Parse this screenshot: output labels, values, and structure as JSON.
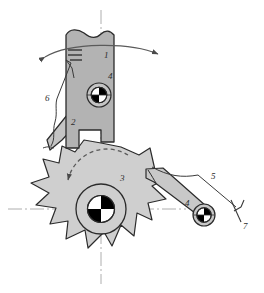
{
  "diagram": {
    "type": "mechanical-kinematic-schematic",
    "background": "#ffffff",
    "colors": {
      "outline": "#2b2b2b",
      "wheel_fill": "#cfcfcf",
      "bar_fill": "#b3b3b3",
      "pawl_fill": "#c4c4c4",
      "arm_fill": "#c8c8c8",
      "joint_black": "#000000",
      "joint_white": "#ffffff",
      "centerline": "#9a9a9a",
      "leader": "#3a3a3a"
    },
    "labels": [
      {
        "id": "1",
        "text": "1",
        "x": 104,
        "y": 55,
        "refers_to": "oscillating-driver-bar"
      },
      {
        "id": "2",
        "text": "2",
        "x": 71,
        "y": 122,
        "refers_to": "driving-pawl"
      },
      {
        "id": "3",
        "text": "3",
        "x": 120,
        "y": 178,
        "refers_to": "ratchet-wheel"
      },
      {
        "id": "4a",
        "text": "4",
        "x": 108,
        "y": 76,
        "refers_to": "pin-joint-upper"
      },
      {
        "id": "4b",
        "text": "4",
        "x": 188,
        "y": 203,
        "refers_to": "holding-arm"
      },
      {
        "id": "5",
        "text": "5",
        "x": 211,
        "y": 176,
        "refers_to": "return-spring-right"
      },
      {
        "id": "6",
        "text": "6",
        "x": 46,
        "y": 98,
        "refers_to": "return-spring-left"
      },
      {
        "id": "7",
        "text": "7",
        "x": 245,
        "y": 225,
        "refers_to": "fixed-ground-support"
      }
    ],
    "annotations": {
      "oscillation_arc": "double-headed arc arrow above bar 1 indicating reciprocating swing",
      "rotation_arc": "dashed curved arrow inside wheel indicating counter-clockwise indexing",
      "break_symbol_top": "wavy break line at top of bar 1",
      "hatch_marks": "two short parallel tick marks on left edge of bar 1",
      "ground_symbol": "short forked line terminating leader 7"
    },
    "components": [
      {
        "name": "oscillating-driver-bar",
        "label": "1"
      },
      {
        "name": "driving-pawl",
        "label": "2"
      },
      {
        "name": "ratchet-wheel",
        "label": "3",
        "teeth": 10
      },
      {
        "name": "pin-joint-upper",
        "label": "4"
      },
      {
        "name": "holding-arm",
        "label": "4"
      },
      {
        "name": "return-spring-right",
        "label": "5"
      },
      {
        "name": "return-spring-left",
        "label": "6"
      },
      {
        "name": "fixed-ground-support",
        "label": "7"
      }
    ]
  }
}
